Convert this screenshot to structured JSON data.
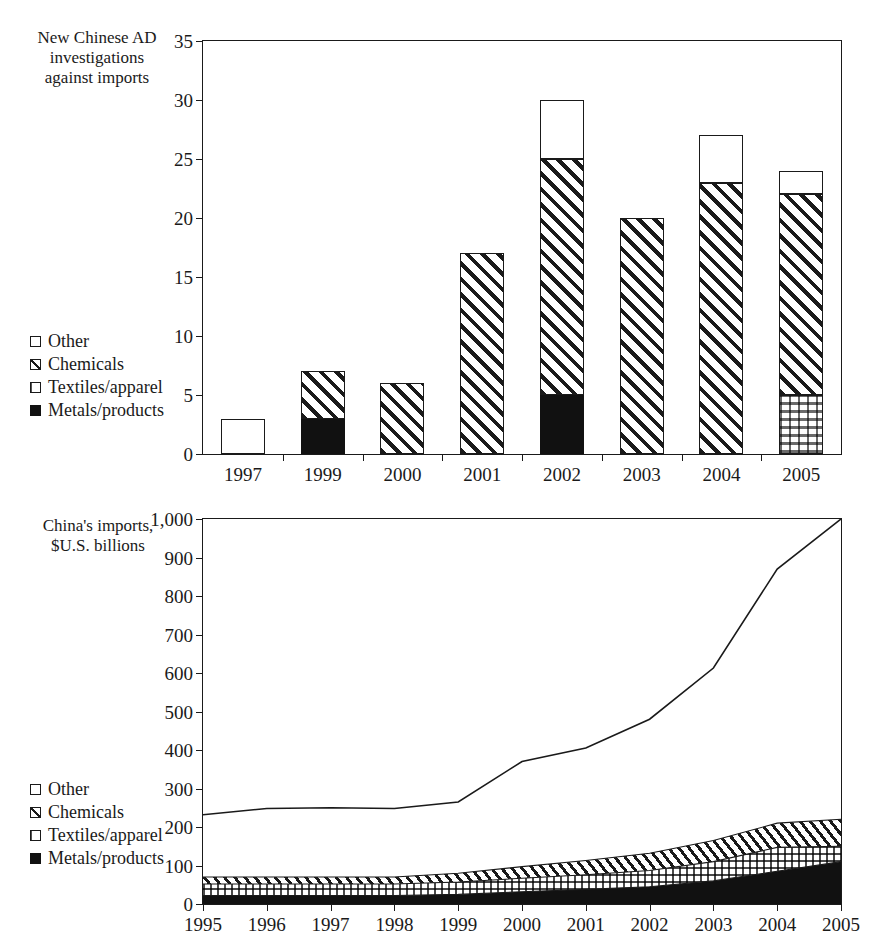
{
  "top_chart": {
    "axis_title": "New Chinese AD\ninvestigations\nagainst  imports",
    "y_ticks": [
      "0",
      "5",
      "10",
      "15",
      "20",
      "25",
      "30",
      "35"
    ],
    "x_labels": [
      "1997",
      "1999",
      "2000",
      "2001",
      "2002",
      "2003",
      "2004",
      "2005"
    ],
    "legend": [
      {
        "key": "other",
        "label": "Other"
      },
      {
        "key": "chem",
        "label": "Chemicals"
      },
      {
        "key": "tex",
        "label": "Textiles/apparel"
      },
      {
        "key": "met",
        "label": "Metals/products"
      }
    ]
  },
  "bottom_chart": {
    "axis_title": "China's imports,\n$U.S. billions",
    "y_ticks": [
      "0",
      "100",
      "200",
      "300",
      "400",
      "500",
      "600",
      "700",
      "800",
      "900",
      "1,000"
    ],
    "x_labels": [
      "1995",
      "1996",
      "1997",
      "1998",
      "1999",
      "2000",
      "2001",
      "2002",
      "2003",
      "2004",
      "2005"
    ],
    "legend": [
      {
        "key": "other",
        "label": "Other"
      },
      {
        "key": "chem",
        "label": "Chemicals"
      },
      {
        "key": "tex",
        "label": "Textiles/apparel"
      },
      {
        "key": "met",
        "label": "Metals/products"
      }
    ]
  },
  "chart_data": [
    {
      "type": "bar",
      "id": "new-chinese-ad-investigations",
      "title": "",
      "xlabel": "",
      "ylabel": "New Chinese AD investigations against  imports",
      "stacked": true,
      "grid": false,
      "legend_position": "left-middle",
      "categories": [
        "1997",
        "1999",
        "2000",
        "2001",
        "2002",
        "2003",
        "2004",
        "2005"
      ],
      "ylim": [
        0,
        35
      ],
      "ytick_step": 5,
      "series": [
        {
          "name": "Metals/products",
          "fill": "solid-black",
          "values": [
            0,
            3,
            0,
            0,
            5,
            0,
            0,
            0
          ]
        },
        {
          "name": "Textiles/apparel",
          "fill": "dotted",
          "values": [
            0,
            0,
            0,
            0,
            0,
            0,
            0,
            5
          ]
        },
        {
          "name": "Chemicals",
          "fill": "diagonal-hatch",
          "values": [
            0,
            4,
            6,
            17,
            20,
            20,
            23,
            17
          ]
        },
        {
          "name": "Other",
          "fill": "white",
          "values": [
            3,
            0,
            0,
            0,
            5,
            0,
            4,
            2
          ]
        }
      ],
      "totals": [
        3,
        7,
        6,
        17,
        30,
        20,
        27,
        24
      ]
    },
    {
      "type": "area",
      "id": "chinas-imports",
      "title": "",
      "xlabel": "",
      "ylabel": "China's imports, $U.S. billions",
      "stacked": true,
      "grid": false,
      "legend_position": "left-lower",
      "x": [
        "1995",
        "1996",
        "1997",
        "1998",
        "1999",
        "2000",
        "2001",
        "2002",
        "2003",
        "2004",
        "2005"
      ],
      "ylim": [
        0,
        1000
      ],
      "ytick_step": 100,
      "series": [
        {
          "name": "Metals/products",
          "fill": "solid-black",
          "values": [
            22,
            22,
            22,
            22,
            25,
            32,
            38,
            45,
            60,
            85,
            110
          ]
        },
        {
          "name": "Textiles/apparel",
          "fill": "dotted",
          "values": [
            30,
            30,
            30,
            30,
            32,
            35,
            38,
            42,
            50,
            62,
            40
          ]
        },
        {
          "name": "Chemicals",
          "fill": "diagonal-hatch",
          "values": [
            18,
            18,
            18,
            18,
            23,
            30,
            37,
            45,
            55,
            63,
            70
          ]
        },
        {
          "name": "Other (to total line)",
          "fill": "white",
          "values": [
            162,
            178,
            180,
            178,
            185,
            273,
            292,
            348,
            448,
            660,
            780
          ]
        }
      ],
      "cumulative_metals": [
        22,
        22,
        22,
        22,
        25,
        32,
        38,
        45,
        60,
        85,
        110
      ],
      "cumulative_textiles": [
        52,
        52,
        52,
        52,
        57,
        67,
        76,
        87,
        110,
        147,
        150
      ],
      "cumulative_chemicals": [
        70,
        70,
        70,
        70,
        80,
        97,
        113,
        132,
        165,
        210,
        220
      ],
      "total_imports_line": [
        232,
        248,
        250,
        248,
        265,
        370,
        405,
        480,
        613,
        870,
        1000
      ]
    }
  ]
}
